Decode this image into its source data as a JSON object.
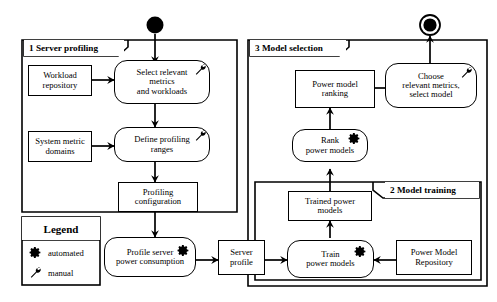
{
  "diagram": {
    "type": "UML activity diagram",
    "start_node": "start-node",
    "end_node": "end-node",
    "frames": [
      {
        "id": "frame1",
        "label": "1 Server profiling"
      },
      {
        "id": "frame2",
        "label": "2 Model training"
      },
      {
        "id": "frame3",
        "label": "3 Model selection"
      }
    ],
    "legend": {
      "title": "Legend",
      "items": [
        {
          "icon": "gear-icon",
          "label": "automated"
        },
        {
          "icon": "wrench-icon",
          "label": "manual"
        }
      ]
    },
    "nodes": [
      {
        "id": "workload_repository",
        "label": "Workload\nrepository",
        "shape": "rect",
        "icon": "none"
      },
      {
        "id": "select_metrics",
        "label": "Select relevant\nmetrics\nand workloads",
        "shape": "round",
        "icon": "wrench-icon"
      },
      {
        "id": "system_metric",
        "label": "System metric\ndomains",
        "shape": "rect",
        "icon": "none"
      },
      {
        "id": "define_profiling",
        "label": "Define profiling\nranges",
        "shape": "round",
        "icon": "wrench-icon"
      },
      {
        "id": "profiling_config",
        "label": "Profiling\nconfiguration",
        "shape": "rect",
        "icon": "none"
      },
      {
        "id": "profile_server",
        "label": "Profile server\npower consumption",
        "shape": "round",
        "icon": "gear-icon"
      },
      {
        "id": "server_profile",
        "label": "Server\nprofile",
        "shape": "rect",
        "icon": "none"
      },
      {
        "id": "train_power_models",
        "label": "Train\npower models",
        "shape": "round",
        "icon": "gear-icon"
      },
      {
        "id": "power_model_repo",
        "label": "Power Model\nRepository",
        "shape": "rect",
        "icon": "none"
      },
      {
        "id": "trained_power_models",
        "label": "Trained power\nmodels",
        "shape": "rect",
        "icon": "none"
      },
      {
        "id": "rank_power_models",
        "label": "Rank\npower models",
        "shape": "round",
        "icon": "gear-icon"
      },
      {
        "id": "power_model_ranking",
        "label": "Power model\nranking",
        "shape": "rect",
        "icon": "none"
      },
      {
        "id": "choose_metrics",
        "label": "Choose\nrelevant metrics,\nselect model",
        "shape": "round",
        "icon": "wrench-icon"
      }
    ]
  },
  "colors": {
    "line": "#000000",
    "fill": "#ffffff",
    "text": "#000000"
  }
}
